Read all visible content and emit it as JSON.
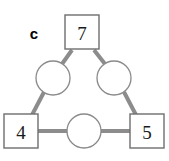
{
  "figure": {
    "panel_label": "c",
    "background_color": "#ffffff",
    "edge_color": "#8c8c8c",
    "square_stroke_color": "#6e6e6e",
    "circle_stroke_color": "#8a8a8a",
    "value_text_color": "#1a1a1a",
    "square_nodes": [
      {
        "id": "top",
        "value": "7",
        "cx": 82,
        "cy": 32,
        "size": 34
      },
      {
        "id": "bottom-left",
        "value": "4",
        "cx": 21,
        "cy": 131,
        "size": 34
      },
      {
        "id": "bottom-right",
        "value": "5",
        "cx": 147,
        "cy": 131,
        "size": 34
      }
    ],
    "circle_nodes": [
      {
        "id": "left",
        "value": "",
        "cx": 53,
        "cy": 78,
        "r": 17
      },
      {
        "id": "right",
        "value": "",
        "cx": 114,
        "cy": 78,
        "r": 17
      },
      {
        "id": "bottom",
        "value": "",
        "cx": 84,
        "cy": 131,
        "r": 17
      }
    ],
    "edges": [
      {
        "id": "top-to-left",
        "x1": 72,
        "y1": 50,
        "x2": 62,
        "y2": 64
      },
      {
        "id": "top-to-right",
        "x1": 94,
        "y1": 50,
        "x2": 105,
        "y2": 64
      },
      {
        "id": "left-to-bottom-left",
        "x1": 44,
        "y1": 92,
        "x2": 32,
        "y2": 115
      },
      {
        "id": "right-to-bottom-right",
        "x1": 124,
        "y1": 92,
        "x2": 136,
        "y2": 115
      },
      {
        "id": "bottom-left-to-bottom",
        "x1": 38,
        "y1": 131,
        "x2": 68,
        "y2": 131
      },
      {
        "id": "bottom-to-bottom-right",
        "x1": 101,
        "y1": 131,
        "x2": 130,
        "y2": 131
      }
    ]
  }
}
